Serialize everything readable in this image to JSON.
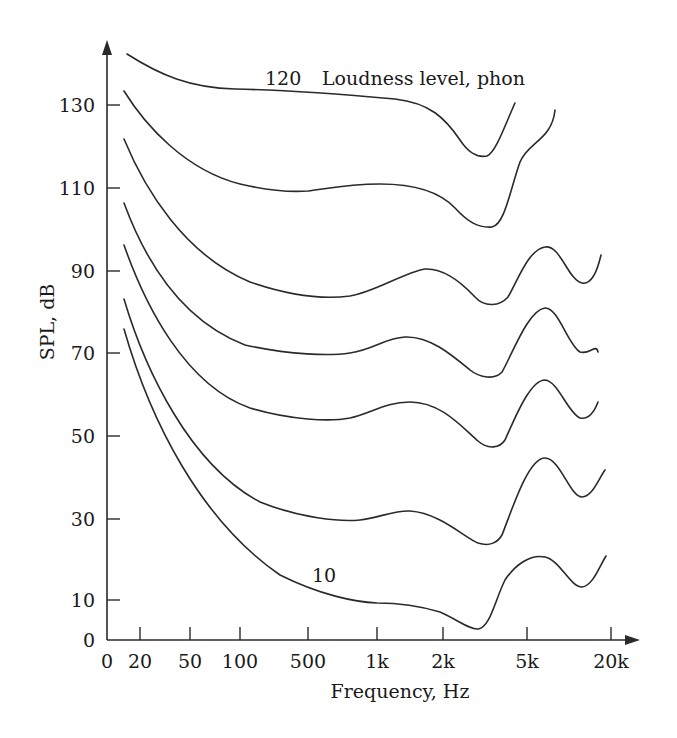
{
  "chart_data": {
    "type": "line",
    "title": "",
    "xlabel": "Frequency, Hz",
    "ylabel": "SPL, dB",
    "x_scale": "log (schematic)",
    "ylim": [
      0,
      140
    ],
    "grid": false,
    "x_ticks": [
      {
        "label": "0",
        "px": 107
      },
      {
        "label": "20",
        "px": 140
      },
      {
        "label": "50",
        "px": 190
      },
      {
        "label": "100",
        "px": 240
      },
      {
        "label": "500",
        "px": 308
      },
      {
        "label": "1k",
        "px": 377
      },
      {
        "label": "2k",
        "px": 443
      },
      {
        "label": "5k",
        "px": 527
      },
      {
        "label": "20k",
        "px": 611
      }
    ],
    "y_ticks": [
      {
        "label": "130",
        "px": 105
      },
      {
        "label": "110",
        "px": 188
      },
      {
        "label": "90",
        "px": 271
      },
      {
        "label": "70",
        "px": 353
      },
      {
        "label": "50",
        "px": 436
      },
      {
        "label": "30",
        "px": 519
      },
      {
        "label": "10",
        "px": 600
      },
      {
        "label": "0",
        "px": 640
      }
    ],
    "annotations": [
      {
        "text": "120",
        "x_px": 265,
        "y_px": 85
      },
      {
        "text": "Loudness level, phon",
        "x_px": 330,
        "y_px": 85
      },
      {
        "text": "10",
        "x_px": 312,
        "y_px": 582
      }
    ],
    "x_categories": [
      "20",
      "50",
      "100",
      "500",
      "1k",
      "2k",
      "3k",
      "5k",
      "8k",
      "12k"
    ],
    "series": [
      {
        "name": "120 phon",
        "values": [
          141,
          136,
          134,
          133,
          133,
          132,
          118,
          130,
          null,
          null
        ],
        "path": "M127,54 C160,75 190,88 235,89 C290,90 350,95 395,99 C430,103 445,118 460,140 C468,152 476,158 487,156 C496,152 505,125 515,103"
      },
      {
        "name": "100 phon",
        "values": [
          132,
          120,
          113,
          110,
          111,
          110,
          101,
          118,
          128,
          null
        ],
        "path": "M124,91 C145,125 185,170 240,184 C270,191 295,192 308,191 C330,188 350,184 380,184 C410,184 438,190 455,208 C468,222 478,228 492,227 C505,224 510,190 520,162 C528,142 552,140 555,110"
      },
      {
        "name": "80 phon",
        "values": [
          121,
          101,
          92,
          84,
          86,
          91,
          82,
          94,
          88,
          94
        ],
        "path": "M124,139 C145,190 185,255 250,282 C285,294 320,300 350,296 C375,292 405,272 425,269 C445,268 462,283 475,297 C485,308 500,306 508,297 C518,280 528,250 545,247 C560,244 568,280 582,283 C592,285 598,268 601,255"
      },
      {
        "name": "60 phon",
        "values": [
          111,
          86,
          74,
          64,
          66,
          64,
          58,
          74,
          64,
          71
        ],
        "path": "M124,203 C145,260 180,320 245,345 C290,355 330,356 350,353 C375,349 385,338 405,337 C430,336 452,355 470,370 C480,378 495,380 502,372 C512,355 528,310 545,308 C558,307 568,345 580,352 C590,355 596,343 598,352"
      },
      {
        "name": "50 phon",
        "values": [
          100,
          78,
          64,
          50,
          52,
          50,
          42,
          61,
          54,
          53
        ],
        "path": "M124,245 C145,305 185,385 250,408 C290,420 330,422 350,418 C372,413 385,402 410,402 C440,402 460,425 478,441 C488,450 500,448 505,440 C515,418 530,380 545,380 C558,381 568,413 580,418 C590,420 595,410 598,402"
      },
      {
        "name": "30 phon",
        "values": [
          91,
          64,
          51,
          37,
          31,
          32,
          26,
          45,
          35,
          42
        ],
        "path": "M124,299 C145,370 190,465 260,502 C300,518 340,522 360,520 C378,518 395,510 410,511 C440,513 465,538 478,543 C490,547 498,542 502,535 C512,510 528,458 545,458 C560,458 570,497 582,497 C592,497 598,480 605,470"
      },
      {
        "name": "10 phon",
        "values": [
          82,
          55,
          39,
          14,
          9,
          8,
          3,
          20,
          15,
          21
        ],
        "path": "M124,329 C150,420 200,520 280,575 C320,595 355,602 377,603 C400,603 420,606 440,612 C458,620 470,630 478,629 C490,628 495,600 505,580 C515,565 530,554 545,557 C560,560 570,587 582,587 C593,586 600,565 606,556"
      }
    ]
  }
}
